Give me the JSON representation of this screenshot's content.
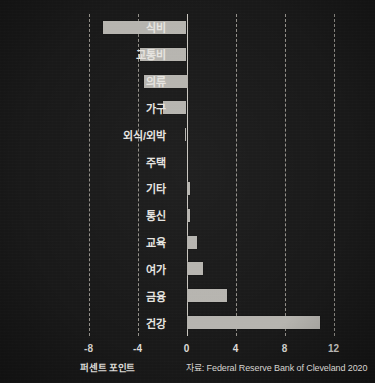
{
  "chart_data": {
    "type": "bar",
    "orientation": "horizontal",
    "title": "",
    "subtitle": "",
    "xlabel": "퍼센트 포인트",
    "ylabel": "",
    "xlim": [
      -8,
      12
    ],
    "xticks": [
      -8,
      -4,
      0,
      4,
      8,
      12
    ],
    "xtick_labels": [
      "-8",
      "-4",
      "0",
      "4",
      "8",
      "12"
    ],
    "grid": true,
    "grid_axis": "x",
    "grid_style": "dotted",
    "legend": null,
    "source_note": "자료: Federal Reserve Bank of Cleveland 2020",
    "categories": [
      "식비",
      "교통비",
      "의류",
      "가구",
      "외식/외박",
      "주택",
      "기타",
      "통신",
      "교육",
      "여가",
      "금융",
      "건강"
    ],
    "values": [
      -6.8,
      -3.8,
      -3.5,
      -1.9,
      -0.1,
      0.0,
      0.25,
      0.25,
      0.85,
      1.35,
      3.3,
      10.9
    ],
    "bar_color": "#b6b4af",
    "background_color": "#191919",
    "text_color": "#e6e4e0"
  }
}
